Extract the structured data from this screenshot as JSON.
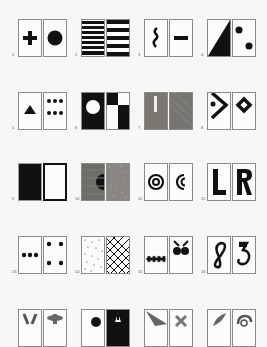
{
  "figure": {
    "pairs": [
      {
        "number": "1",
        "left": "black-plus",
        "right": "black-circle"
      },
      {
        "number": "2",
        "left": "horizontal-stripes-narrow",
        "right": "horizontal-stripes-wide"
      },
      {
        "number": "3",
        "left": "wavy-vertical-line",
        "right": "horizontal-bar"
      },
      {
        "number": "4",
        "left": "diagonal-half-black",
        "right": "two-dots-diagonal"
      },
      {
        "number": "5",
        "left": "black-triangle",
        "right": "six-dots"
      },
      {
        "number": "6",
        "left": "white-circle-on-black",
        "right": "checkerboard-2x2"
      },
      {
        "number": "7",
        "left": "grey-with-white-bar",
        "right": "grey-texture"
      },
      {
        "number": "8",
        "left": "chevron-with-dot",
        "right": "diamond-outline"
      },
      {
        "number": "9",
        "left": "black-fill",
        "right": "white-thick-border"
      },
      {
        "number": "10",
        "left": "grey-with-half-circle",
        "right": "grey-noise"
      },
      {
        "number": "11",
        "left": "concentric-circles",
        "right": "crescent-arcs"
      },
      {
        "number": "12",
        "left": "letter-L",
        "right": "letter-R"
      },
      {
        "number": "13",
        "left": "three-dots-row",
        "right": "four-dots-corners"
      },
      {
        "number": "14",
        "left": "sparse-dots-texture",
        "right": "crosshatch"
      },
      {
        "number": "15",
        "left": "insects-row",
        "right": "butterfly-shape"
      },
      {
        "number": "16",
        "left": "figure-8-shape",
        "right": "curl-shape"
      },
      {
        "number": "17",
        "left": "v-shape",
        "right": "bow-shape"
      },
      {
        "number": "18",
        "left": "black-blob",
        "right": "white-shape-on-black"
      },
      {
        "number": "19",
        "left": "grey-triangle",
        "right": "grey-x-shape"
      },
      {
        "number": "20",
        "left": "grey-leaf",
        "right": "grey-swirl"
      }
    ]
  }
}
